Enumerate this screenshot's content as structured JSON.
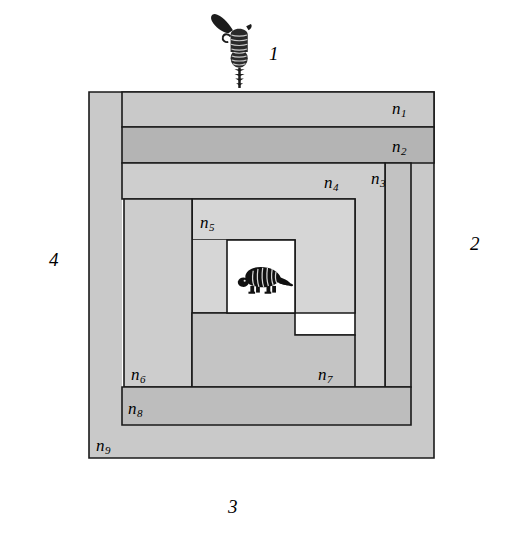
{
  "figure": {
    "background_color": "#ffffff",
    "stroke_color": "#1a1a1a",
    "region_labels": [
      {
        "id": "n1",
        "base": "n",
        "sub": "1",
        "x": 392,
        "y": 100,
        "fill": "#c9c9c9"
      },
      {
        "id": "n2",
        "base": "n",
        "sub": "2",
        "x": 392,
        "y": 138,
        "fill": "#b4b4b4"
      },
      {
        "id": "n3",
        "base": "n",
        "sub": "3",
        "x": 371,
        "y": 170,
        "fill": "#c2c2c2"
      },
      {
        "id": "n4",
        "base": "n",
        "sub": "4",
        "x": 324,
        "y": 174,
        "fill": "#cecece"
      },
      {
        "id": "n5",
        "base": "n",
        "sub": "5",
        "x": 200,
        "y": 214,
        "fill": "#d6d6d6"
      },
      {
        "id": "n6",
        "base": "n",
        "sub": "6",
        "x": 131,
        "y": 366,
        "fill": "#cdcdcd"
      },
      {
        "id": "n7",
        "base": "n",
        "sub": "7",
        "x": 318,
        "y": 366,
        "fill": "#c4c4c4"
      },
      {
        "id": "n8",
        "base": "n",
        "sub": "8",
        "x": 128,
        "y": 400,
        "fill": "#bdbdbd"
      },
      {
        "id": "n9",
        "base": "n",
        "sub": "9",
        "x": 96,
        "y": 437,
        "fill": "#c9c9c9"
      }
    ],
    "shooters": [
      {
        "id": "shooter-1",
        "label": "1",
        "position": "top",
        "direction": "down",
        "label_x": 269,
        "label_y": 44
      },
      {
        "id": "shooter-2",
        "label": "2",
        "position": "right",
        "direction": "left",
        "label_x": 470,
        "label_y": 234
      },
      {
        "id": "shooter-3",
        "label": "3",
        "position": "bottom",
        "direction": "up",
        "label_x": 228,
        "label_y": 497
      },
      {
        "id": "shooter-4",
        "label": "4",
        "position": "left",
        "direction": "right",
        "label_x": 49,
        "label_y": 250
      }
    ],
    "center_figure": {
      "name": "armadillo",
      "facing": "left"
    }
  }
}
